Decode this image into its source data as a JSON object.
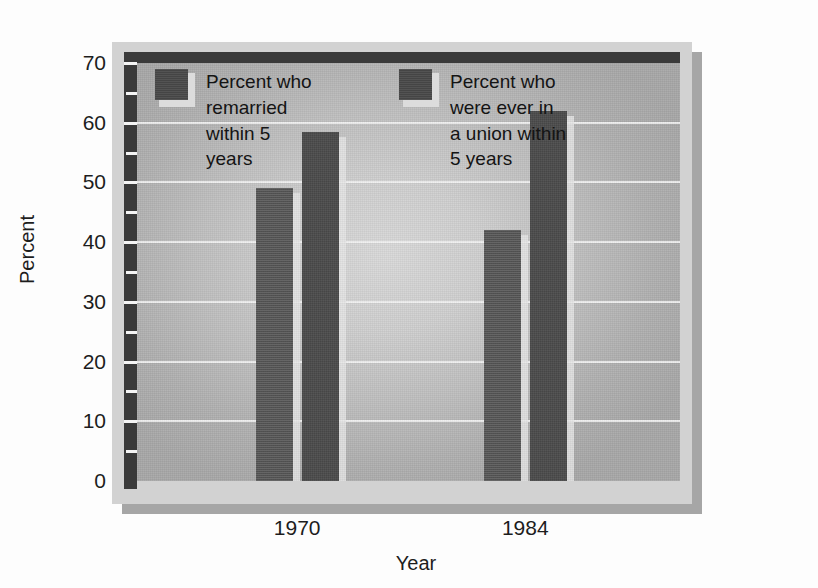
{
  "chart_data": {
    "type": "bar",
    "title": "",
    "xlabel": "Year",
    "ylabel": "Percent",
    "categories": [
      "1970",
      "1984"
    ],
    "ylim": [
      0,
      70
    ],
    "ytick_labels": [
      "0",
      "10",
      "20",
      "30",
      "40",
      "50",
      "60",
      "70"
    ],
    "ytick_values": [
      0,
      10,
      20,
      30,
      40,
      50,
      60,
      70
    ],
    "minor_tick_values": [
      5,
      15,
      25,
      35,
      45,
      55,
      65
    ],
    "grid": true,
    "legend_position": "upper-center-inside",
    "series": [
      {
        "name": "Percent who\nremarried\nwithin 5\nyears",
        "values": [
          49,
          42
        ],
        "color": "#4a4a4a"
      },
      {
        "name": "Percent who\nwere ever in\na union within\n5 years",
        "values": [
          58.5,
          62
        ],
        "color": "#4a4a4a"
      }
    ]
  },
  "axes": {
    "y_title": "Percent",
    "x_title": "Year"
  },
  "ylabels": [
    {
      "text": "70",
      "value": 70
    },
    {
      "text": "60",
      "value": 60
    },
    {
      "text": "50",
      "value": 50
    },
    {
      "text": "40",
      "value": 40
    },
    {
      "text": "30",
      "value": 30
    },
    {
      "text": "20",
      "value": 20
    },
    {
      "text": "10",
      "value": 10
    },
    {
      "text": "0",
      "value": 0
    }
  ],
  "xlabels": [
    {
      "text": "1970"
    },
    {
      "text": "1984"
    }
  ],
  "legend": [
    {
      "label": "Percent who\nremarried\nwithin 5\nyears"
    },
    {
      "label": "Percent who\nwere ever in\na union within\n5 years"
    }
  ],
  "colors": {
    "bar": "#4a4a4a",
    "plot_background_center": "#d9d9d9",
    "plot_background_edge": "#a7a7a7",
    "frame": "#d2d2d2",
    "frame_border_dark": "#3a3a3a",
    "shadow": "#a6a6a6",
    "gridline": "#f2f2f2",
    "text": "#1d1d1d",
    "page_background": "#fdfdfd"
  }
}
